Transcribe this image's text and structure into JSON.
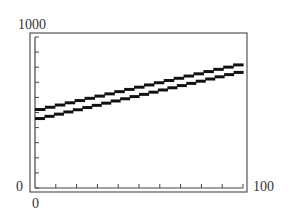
{
  "chart_data": {
    "type": "line",
    "title": "",
    "xlabel": "",
    "ylabel": "",
    "xlim": [
      0,
      100
    ],
    "ylim": [
      0,
      1000
    ],
    "x_tick_count": 10,
    "y_tick_count": 10,
    "tick_labels": {
      "y_max": "1000",
      "y_min": "0",
      "x_min": "0",
      "x_max": "100"
    },
    "grid": false,
    "legend": null,
    "style": "graphing-calculator stepped pixels",
    "series": [
      {
        "name": "upper",
        "x": [
          0,
          100
        ],
        "y": [
          520,
          830
        ]
      },
      {
        "name": "lower",
        "x": [
          0,
          100
        ],
        "y": [
          460,
          780
        ]
      }
    ]
  },
  "colors": {
    "line": "#111111",
    "frame": "#444444",
    "background": "#ffffff"
  }
}
